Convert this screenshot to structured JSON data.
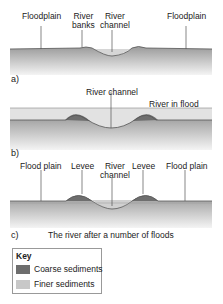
{
  "panels": [
    {
      "letter": "a)",
      "labels": [
        "Floodplain",
        "River banks",
        "River channel",
        "Floodplain"
      ],
      "label_lines": [
        [
          "Floodplain"
        ],
        [
          "River",
          "banks"
        ],
        [
          "River",
          "channel"
        ],
        [
          "Floodplain"
        ]
      ]
    },
    {
      "letter": "b)",
      "labels": [
        "River channel",
        "River in flood"
      ]
    },
    {
      "letter": "c)",
      "labels": [
        "Flood plain",
        "Levee",
        "River channel",
        "Levee",
        "Flood plain"
      ],
      "label_lines": [
        [
          "Flood plain"
        ],
        [
          "Levee"
        ],
        [
          "River",
          "channel"
        ],
        [
          "Levee"
        ],
        [
          "Flood plain"
        ]
      ],
      "caption": "The river after a number of floods"
    }
  ],
  "key": {
    "title": "Key",
    "items": [
      {
        "label": "Coarse sediments",
        "color": "#6e6e6e"
      },
      {
        "label": "Finer sediments",
        "color": "#c8c8c8"
      }
    ]
  },
  "colors": {
    "ground_top": "#9a9a9a",
    "ground_bottom": "#f2f2f2",
    "water": "#d6d6d6",
    "coarse": "#6e6e6e",
    "fine": "#c8c8c8",
    "line": "#555555"
  }
}
